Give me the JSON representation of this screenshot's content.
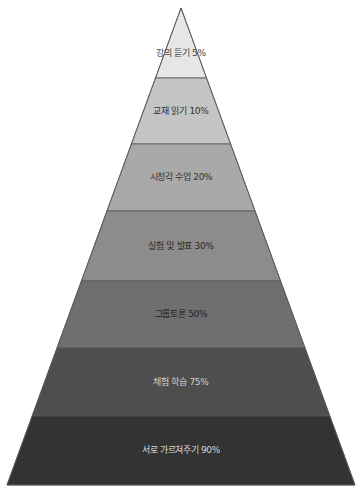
{
  "diagram": {
    "type": "pyramid",
    "title": "",
    "apex": {
      "x": 181,
      "y": 8
    },
    "base": {
      "left_x": 7,
      "right_x": 355,
      "y": 485
    },
    "outline_color": "#555555",
    "layers": [
      {
        "label": "강의 듣기 5%",
        "activity": "강의 듣기",
        "percent": 5,
        "top": 8,
        "bottom": 78,
        "fill": "#e6e6e6",
        "text_color": "#444444"
      },
      {
        "label": "교재 읽기 10%",
        "activity": "교재 읽기",
        "percent": 10,
        "top": 78,
        "bottom": 144,
        "fill": "#c4c4c4",
        "text_color": "#333333"
      },
      {
        "label": "시청각 수업 20%",
        "activity": "시청각 수업",
        "percent": 20,
        "top": 144,
        "bottom": 211,
        "fill": "#a9a9a9",
        "text_color": "#333333"
      },
      {
        "label": "실험 및 발표 30%",
        "activity": "실험 및 발표",
        "percent": 30,
        "top": 211,
        "bottom": 281,
        "fill": "#8c8c8c",
        "text_color": "#2a2a2a"
      },
      {
        "label": "그룹토론 50%",
        "activity": "그룹토론",
        "percent": 50,
        "top": 281,
        "bottom": 348,
        "fill": "#6f6f6f",
        "text_color": "#222222"
      },
      {
        "label": "체험 학습 75%",
        "activity": "체험 학습",
        "percent": 75,
        "top": 348,
        "bottom": 416,
        "fill": "#4e4e4e",
        "text_color": "#d0d0d0"
      },
      {
        "label": "서로 가르쳐주기 90%",
        "activity": "서로 가르쳐주기",
        "percent": 90,
        "top": 416,
        "bottom": 485,
        "fill": "#333333",
        "text_color": "#d8d8d8"
      }
    ]
  },
  "caption": {
    "text": "",
    "note": "faint cropped source caption at bottom-right, illegible"
  }
}
